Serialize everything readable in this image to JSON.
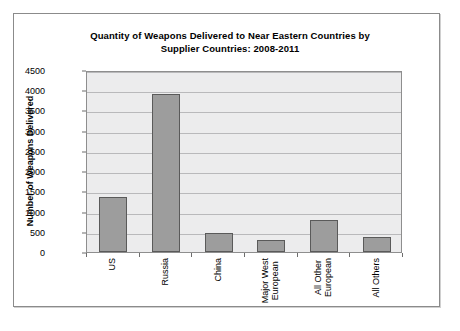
{
  "chart_data": {
    "type": "bar",
    "title": "Quantity of Weapons Delivered to Near Eastern Countries by Supplier Countries: 2008-2011",
    "title_line1": "Quantity of Weapons Delivered to Near Eastern Countries by",
    "title_line2": "Supplier Countries: 2008-2011",
    "xlabel": "",
    "ylabel": "Number of Weapons Delivered",
    "categories": [
      "US",
      "Russia",
      "China",
      "Major West European",
      "All Other European",
      "All Others"
    ],
    "category_lines": [
      [
        "US"
      ],
      [
        "Russia"
      ],
      [
        "China"
      ],
      [
        "Major West",
        "European"
      ],
      [
        "All Other",
        "European"
      ],
      [
        "All Others"
      ]
    ],
    "values": [
      1350,
      3900,
      480,
      290,
      800,
      370
    ],
    "ylim": [
      0,
      4500
    ],
    "ytick_values": [
      4500,
      4000,
      3500,
      3000,
      2500,
      2000,
      1500,
      1000,
      500,
      0
    ],
    "ytick_labels": [
      "4500",
      "4000",
      "3500",
      "3000",
      "2500",
      "2000",
      "1500",
      "1000",
      "500",
      "0"
    ],
    "grid": true,
    "legend": false,
    "legend_position": "none",
    "bar_color": "#9d9d9d",
    "bar_border_color": "#5a5a5a",
    "plot_background": "#ececed",
    "gridline_color": "#b9b9bb",
    "page_background": "#ffffff"
  }
}
